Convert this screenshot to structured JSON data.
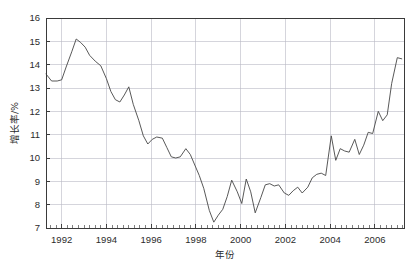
{
  "chart_data": {
    "type": "line",
    "title": "",
    "xlabel": "年份",
    "ylabel": "增长率/%",
    "grid": true,
    "legend": "none",
    "xlim": [
      1991.3,
      2007.3
    ],
    "ylim": [
      7,
      16
    ],
    "yticks": [
      7,
      8,
      9,
      10,
      11,
      12,
      13,
      14,
      15,
      16
    ],
    "ytick_labels": [
      "7",
      "8",
      "9",
      "10",
      "11",
      "12",
      "13",
      "14",
      "15",
      "16"
    ],
    "xticks": [
      1992,
      1994,
      1996,
      1998,
      2000,
      2002,
      2004,
      2006
    ],
    "xtick_labels": [
      "1992",
      "1994",
      "1996",
      "1998",
      "2000",
      "2002",
      "2004",
      "2006"
    ],
    "x_minor_tick_interval": 0.25,
    "series": [
      {
        "name": "增长率",
        "color": "#464646",
        "x": [
          1991.3,
          1991.55,
          1991.8,
          1992.0,
          1992.2,
          1992.45,
          1992.65,
          1992.85,
          1993.05,
          1993.25,
          1993.5,
          1993.75,
          1994.0,
          1994.2,
          1994.4,
          1994.6,
          1994.8,
          1995.0,
          1995.2,
          1995.45,
          1995.65,
          1995.85,
          1996.05,
          1996.25,
          1996.5,
          1996.7,
          1996.9,
          1997.1,
          1997.3,
          1997.55,
          1997.75,
          1997.95,
          1998.15,
          1998.35,
          1998.6,
          1998.8,
          1999.0,
          1999.2,
          1999.4,
          1999.6,
          1999.85,
          2000.05,
          2000.25,
          2000.45,
          2000.65,
          2000.9,
          2001.1,
          2001.3,
          2001.5,
          2001.7,
          2001.95,
          2002.15,
          2002.35,
          2002.55,
          2002.75,
          2003.0,
          2003.2,
          2003.4,
          2003.6,
          2003.8,
          2004.05,
          2004.25,
          2004.45,
          2004.65,
          2004.85,
          2005.1,
          2005.3,
          2005.5,
          2005.7,
          2005.9,
          2006.15,
          2006.35,
          2006.55,
          2006.75,
          2007.0,
          2007.2
        ],
        "y": [
          13.6,
          13.3,
          13.3,
          13.35,
          13.9,
          14.55,
          15.1,
          14.95,
          14.75,
          14.4,
          14.15,
          13.95,
          13.4,
          12.85,
          12.5,
          12.4,
          12.7,
          13.05,
          12.3,
          11.6,
          10.95,
          10.6,
          10.8,
          10.9,
          10.85,
          10.45,
          10.05,
          10.0,
          10.05,
          10.4,
          10.15,
          9.7,
          9.25,
          8.7,
          7.75,
          7.25,
          7.55,
          7.8,
          8.35,
          9.05,
          8.55,
          8.05,
          9.1,
          8.55,
          7.65,
          8.3,
          8.85,
          8.9,
          8.8,
          8.85,
          8.5,
          8.4,
          8.6,
          8.75,
          8.5,
          8.75,
          9.15,
          9.3,
          9.35,
          9.25,
          10.95,
          9.9,
          10.4,
          10.3,
          10.25,
          10.8,
          10.15,
          10.55,
          11.1,
          11.05,
          12.0,
          11.6,
          11.85,
          13.2,
          14.3,
          14.25
        ]
      }
    ]
  }
}
